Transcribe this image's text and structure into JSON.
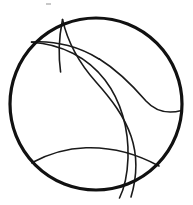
{
  "figure": {
    "description": "Hand-drawn style line figure: a thick black circle outline containing four thin interior arcs that cross one another, dividing the disc into several curved regions.",
    "canvas": {
      "width": 193,
      "height": 205,
      "background_color": "#ffffff"
    },
    "style": {
      "outline_color": "#111111",
      "outline_width": 3.2,
      "arc_color": "#1a1a1a",
      "arc_width": 1.6,
      "stray_mark_color": "#9a9a9a",
      "fill": "none",
      "linecap": "round"
    },
    "circle": {
      "label": "outer-circle",
      "center_x": 96,
      "center_y": 104,
      "radius": 86
    },
    "arcs": [
      {
        "label": "top-short-arc",
        "description": "Short arc descending from the top edge of the circle to the upper-left crossing point.",
        "path": "M 62.5 19.5 C 60.5 29.5, 59.5 37.5, 59.2 47.5 C 59.0 56.5, 59.6 64.5, 60.6 72.0",
        "start_x": 62.5,
        "start_y": 19.5,
        "end_x": 60.6,
        "end_y": 72.0
      },
      {
        "label": "left-horizontal-arc",
        "description": "Nearly horizontal arc leaving the upper-left rim, bowing gently and ending at the crossing cluster near the centre-left.",
        "path": "M 31.5 42.0 C 44.0 41.0, 56.0 42.4, 68.0 45.6 C 80.0 48.8, 90.0 53.4, 99.0 59.0",
        "start_x": 31.5,
        "start_y": 42.0,
        "end_x": 99.0,
        "end_y": 59.0
      },
      {
        "label": "long-lens-arc",
        "description": "Long sweeping arc from upper-left rim curving right and down to the bottom rim, forming the upper boundary of the lens shape.",
        "path": "M 31.6 42.2 C 62.0 44.0, 88.0 58.0, 105.0 80.0 C 121.0 101.0, 129.0 129.0, 128.0 158.0 C 127.3 176.0, 124.0 189.0, 119.5 198.0",
        "start_x": 31.6,
        "start_y": 42.2,
        "end_x": 119.5,
        "end_y": 198.0
      },
      {
        "label": "center-s-arc",
        "description": "Main long arc from the top rim running down through the middle of the disc to the lower rim, forming the lower boundary of the lens shape.",
        "path": "M 62.6 19.6 C 68.0 44.0, 80.0 64.0, 96.0 82.0 C 112.0 100.0, 124.0 116.0, 131.0 136.0 C 137.5 155.0, 137.0 177.0, 131.0 197.0",
        "start_x": 62.6,
        "start_y": 19.6,
        "end_x": 131.0,
        "end_y": 197.0
      },
      {
        "label": "right-horizontal-arc",
        "description": "Gently curved arc running from the central crossing rightwards to the right rim of the circle.",
        "path": "M 99.0 58.8 C 117.0 70.0, 133.0 86.0, 146.0 101.0 C 156.0 112.0, 168.0 114.0, 181.5 110.5",
        "start_x": 99.0,
        "start_y": 58.8,
        "end_x": 181.5,
        "end_y": 110.5
      },
      {
        "label": "bottom-arc",
        "description": "Shallow arc spanning the lower portion of the disc from the lower-left rim to the lower-right rim.",
        "path": "M 31.8 162.8 C 48.0 154.0, 66.0 148.5, 86.0 147.8 C 110.0 147.0, 136.0 153.5, 159.0 166.0",
        "start_x": 31.8,
        "start_y": 162.8,
        "end_x": 159.0,
        "end_y": 166.0
      }
    ],
    "stray_marks": [
      {
        "label": "top-speck",
        "description": "Faint small grey speck above the circle near the top edge of the image.",
        "x": 46,
        "y": 3,
        "width": 5,
        "height": 2
      }
    ]
  }
}
